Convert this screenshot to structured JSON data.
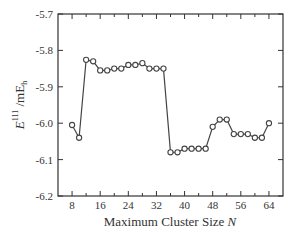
{
  "chart_data": {
    "type": "line",
    "title": "",
    "xlabel": "Maximum Cluster Size N",
    "ylabel": "E^111 /mE_h",
    "xlim": [
      4,
      68
    ],
    "ylim": [
      -6.2,
      -5.7
    ],
    "grid": false,
    "legend": null,
    "xticks": [
      8,
      16,
      24,
      32,
      40,
      48,
      56,
      64
    ],
    "xtick_labels": [
      "8",
      "16",
      "24",
      "32",
      "40",
      "48",
      "56",
      "64"
    ],
    "xminor_ticks": [
      12,
      20,
      28,
      36,
      44,
      52,
      60
    ],
    "yticks": [
      -5.7,
      -5.8,
      -5.9,
      -6.0,
      -6.1,
      -6.2
    ],
    "ytick_labels": [
      "-5.7",
      "-5.8",
      "-5.9",
      "-6.0",
      "-6.1",
      "-6.2"
    ],
    "marker": "open-circle",
    "series": [
      {
        "name": "E111",
        "x": [
          8,
          10,
          12,
          14,
          16,
          18,
          20,
          22,
          24,
          26,
          28,
          30,
          32,
          34,
          36,
          38,
          40,
          42,
          44,
          46,
          48,
          50,
          52,
          54,
          56,
          58,
          60,
          62,
          64
        ],
        "values": [
          -6.005,
          -6.04,
          -5.826,
          -5.83,
          -5.855,
          -5.855,
          -5.85,
          -5.85,
          -5.84,
          -5.84,
          -5.835,
          -5.85,
          -5.85,
          -5.85,
          -6.08,
          -6.08,
          -6.07,
          -6.07,
          -6.07,
          -6.07,
          -6.01,
          -5.99,
          -5.99,
          -6.03,
          -6.03,
          -6.03,
          -6.04,
          -6.04,
          -6.0
        ]
      }
    ]
  },
  "labels": {
    "y_main": "E",
    "y_sup": "111",
    "y_unit": " /mE",
    "y_unit_sub": "h",
    "x_main": "Maximum Cluster Size ",
    "x_var": "N"
  },
  "colors": {
    "line": "#444444",
    "axis": "#333333",
    "marker_fill": "#ffffff"
  }
}
